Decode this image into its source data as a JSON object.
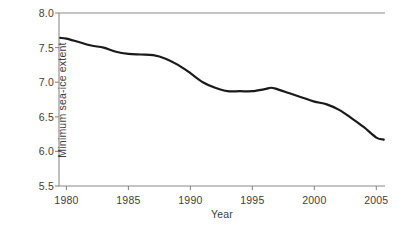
{
  "chart_data": {
    "type": "line",
    "title": "",
    "subtitle": "",
    "xlabel": "Year",
    "ylabel": "Minimum sea-ice extent",
    "xlim": [
      1979.4,
      2005.7
    ],
    "ylim": [
      5.5,
      8.0
    ],
    "xticks": [
      1980,
      1985,
      1990,
      1995,
      2000,
      2005
    ],
    "xtick_labels": [
      "1980",
      "1985",
      "1990",
      "1995",
      "2000",
      "2005"
    ],
    "yticks": [
      5.5,
      6.0,
      6.5,
      7.0,
      7.5,
      8.0
    ],
    "ytick_labels": [
      "5.5",
      "6.0",
      "6.5",
      "7.0",
      "7.5",
      "8.0"
    ],
    "grid": false,
    "legend": null,
    "annotations": [],
    "line_color": "#1a1a1a",
    "line_width": 2.2,
    "axis_color": "#8a8a8a",
    "background_color": "#ffffff",
    "series": [
      {
        "name": "Minimum sea-ice extent",
        "x": [
          1979.5,
          1980,
          1981,
          1982,
          1983,
          1984,
          1985,
          1986,
          1987,
          1988,
          1989,
          1990,
          1991,
          1992,
          1993,
          1994,
          1995,
          1996,
          1996.5,
          1997,
          1998,
          1999,
          2000,
          2001,
          2002,
          2003,
          2004,
          2005,
          2005.6
        ],
        "values": [
          7.64,
          7.63,
          7.58,
          7.53,
          7.5,
          7.44,
          7.41,
          7.4,
          7.39,
          7.34,
          7.25,
          7.13,
          7.0,
          6.92,
          6.87,
          6.87,
          6.87,
          6.9,
          6.92,
          6.9,
          6.84,
          6.78,
          6.72,
          6.68,
          6.6,
          6.48,
          6.35,
          6.2,
          6.17
        ]
      }
    ]
  },
  "figure": {
    "plot_area": {
      "left": 59,
      "right": 385,
      "top": 13,
      "bottom": 186
    }
  }
}
